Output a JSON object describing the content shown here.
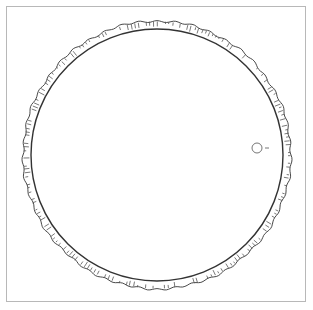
{
  "figure": {
    "type": "line-drawing",
    "colors": {
      "line": "#333333",
      "frame": "#b8b8b8",
      "background": "#ffffff"
    },
    "ring": {
      "cx": 157,
      "cy": 155,
      "outer_r": 134,
      "inner_r": 126
    },
    "marker": {
      "shape": "small-circle",
      "cx": 257,
      "cy": 148,
      "r": 5,
      "dash": true
    }
  }
}
